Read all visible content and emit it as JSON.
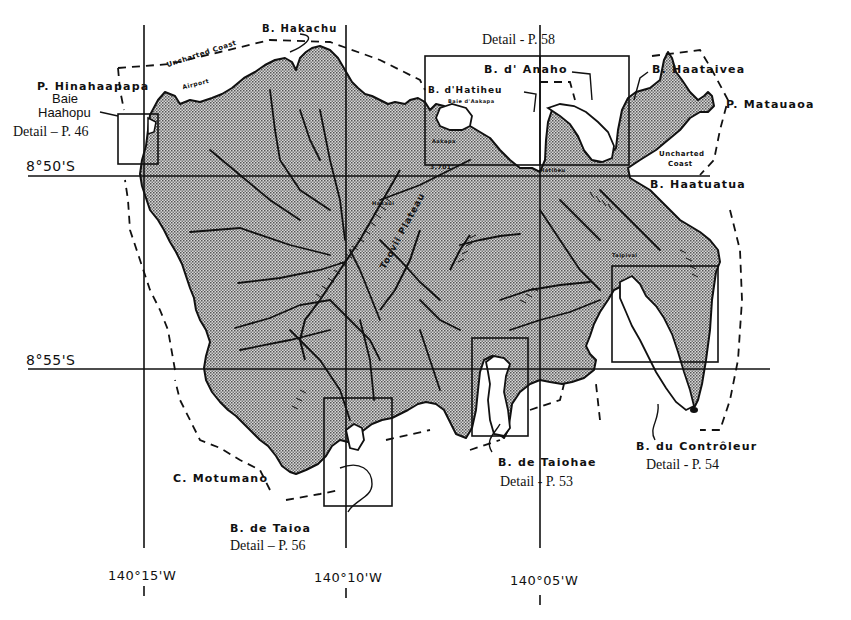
{
  "map": {
    "title": "Nuku Hiva island map with harbor detail insets",
    "colors": {
      "land_fill": "#9a9a9a",
      "ink": "#111111",
      "background": "#ffffff"
    },
    "latitudes": [
      {
        "label": "8°50'S",
        "y": 175
      },
      {
        "label": "8°55'S",
        "y": 369
      }
    ],
    "longitudes": [
      {
        "label": "140°15'W",
        "x": 144
      },
      {
        "label": "140°10'W",
        "x": 346
      },
      {
        "label": "140°05'W",
        "x": 540
      }
    ],
    "place_labels": {
      "p_hinahaapapa": "P. Hinahaapapa",
      "baie_haahopu_1": "Baie",
      "baie_haahopu_2": "Haahopu",
      "b_hakachu": "B. Hakachu",
      "uncharted_coast_nw": "Uncharted Coast",
      "airport": "Airport",
      "b_anaho": "B. d' Anaho",
      "b_hatiheu": "B. d'Hatiheu",
      "baie_aakapa": "Baie d'Aakapa",
      "aakapa": "Aakapa",
      "b_haataivea": "B. Haataivea",
      "p_matauaoa": "P. Matauaoa",
      "uncharted_coast_ne_1": "Uncharted",
      "uncharted_coast_ne_2": "Coast",
      "b_haatuatua": "B. Haatuatua",
      "toovii_plateau": "Toovii Plateau",
      "summit": "3,701'",
      "hatiheu_village": "Hatiheu",
      "c_motumano": "C. Motumano",
      "b_de_taioa": "B. de Taioa",
      "b_de_taiohae": "B. de Taiohae",
      "b_du_controleur": "B. du Contrôleur",
      "taipivai": "Taipivai",
      "hakaui": "Hakaui"
    },
    "detail_insets": [
      {
        "name": "Baie Haahopu",
        "label": "Detail – P. 46",
        "page": 46
      },
      {
        "name": "B. d'Anaho / B. d'Hatiheu",
        "label": "Detail  - P. 58",
        "page": 58
      },
      {
        "name": "B. de Taioa",
        "label": "Detail – P. 56",
        "page": 56
      },
      {
        "name": "B. de Taiohae",
        "label": "Detail  - P. 53",
        "page": 53
      },
      {
        "name": "B. du Contrôleur",
        "label": "Detail  - P. 54",
        "page": 54
      }
    ]
  }
}
